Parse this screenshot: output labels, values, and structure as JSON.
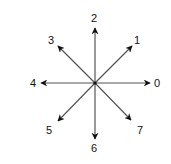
{
  "diagram": {
    "type": "direction-compass",
    "center": [
      95,
      83
    ],
    "line_color": "#555555",
    "arrow_color": "#111111",
    "directions": [
      {
        "label": "0",
        "angle_deg": 0,
        "tip": [
          150,
          83
        ],
        "text_pos": [
          154,
          87
        ]
      },
      {
        "label": "1",
        "angle_deg": 45,
        "tip": [
          132,
          46
        ],
        "text_pos": [
          134,
          44
        ]
      },
      {
        "label": "2",
        "angle_deg": 90,
        "tip": [
          95,
          28
        ],
        "text_pos": [
          91,
          22
        ]
      },
      {
        "label": "3",
        "angle_deg": 135,
        "tip": [
          58,
          46
        ],
        "text_pos": [
          48,
          44
        ]
      },
      {
        "label": "4",
        "angle_deg": 180,
        "tip": [
          41,
          83
        ],
        "text_pos": [
          30,
          87
        ]
      },
      {
        "label": "5",
        "angle_deg": 225,
        "tip": [
          58,
          121
        ],
        "text_pos": [
          46,
          134
        ]
      },
      {
        "label": "6",
        "angle_deg": 270,
        "tip": [
          95,
          139
        ],
        "text_pos": [
          91,
          152
        ]
      },
      {
        "label": "7",
        "angle_deg": 315,
        "tip": [
          131,
          120
        ],
        "text_pos": [
          137,
          134
        ]
      }
    ]
  }
}
